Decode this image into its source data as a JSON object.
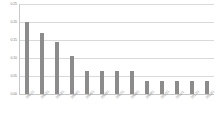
{
  "chart_data": {
    "type": "bar",
    "title": "",
    "xlabel": "",
    "ylabel": "",
    "ylim": [
      0.0,
      0.25
    ],
    "grid": true,
    "legend": false,
    "bar_color": "#8c8c8c",
    "gridline_color": "#d9d9d9",
    "background_color": "#ffffff",
    "axis_label_color": "#808080",
    "yticks": [
      "0.25",
      "0.20",
      "0.15",
      "0.10",
      "0.05",
      "0.00"
    ],
    "ytick_values": [
      0.25,
      0.2,
      0.15,
      0.1,
      0.05,
      0.0
    ],
    "categories": [
      "2001/1",
      "2002/1",
      "2003/1",
      "2004/1",
      "2005/1",
      "2006/1",
      "2007/1",
      "2008/1",
      "2009/1",
      "2010/1",
      "2011/1",
      "2012/1",
      "2013/1"
    ],
    "values": [
      0.2,
      0.17,
      0.145,
      0.105,
      0.065,
      0.065,
      0.065,
      0.065,
      0.035,
      0.035,
      0.035,
      0.035,
      0.035
    ]
  }
}
